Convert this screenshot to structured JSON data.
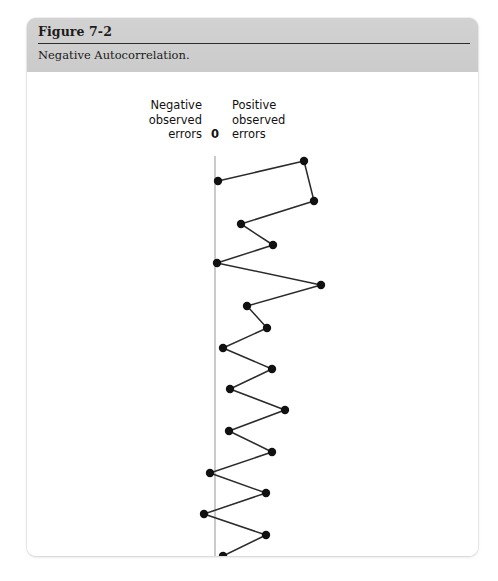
{
  "figure": {
    "number": "Figure 7-2",
    "caption": "Negative Autocorrelation."
  },
  "labels": {
    "negative": "Negative\nobserved\nerrors",
    "negative_line1": "Negative",
    "negative_line2": "observed",
    "negative_line3": "errors",
    "zero": "0",
    "positive_line1": "Positive",
    "positive_line2": "observed",
    "positive_line3": "errors"
  },
  "colors": {
    "header_background": "#cfcfcf",
    "card_background": "#ffffff",
    "page_background": "#ffffff",
    "rule": "#2b2b2b",
    "axis_line": "#b4b4b4",
    "series_line": "#2b2b2b",
    "marker": "#111111",
    "text": "#1b1b1b"
  },
  "chart_data": {
    "type": "line",
    "title": "Negative Autocorrelation.",
    "subtitle": "Figure 7-2",
    "xlabel": "",
    "ylabel": "",
    "orientation": "vertical-sequence",
    "grid": false,
    "legend": false,
    "axis": {
      "zero_label": "0",
      "zero_x": 188,
      "left_label": "Negative observed errors",
      "right_label": "Positive observed errors",
      "line_top": 84,
      "line_bottom": 491,
      "x_min": 150,
      "x_max": 275
    },
    "marker": {
      "shape": "circle",
      "radius": 4.2,
      "color": "#111111"
    },
    "series": [
      {
        "name": "Observed errors",
        "points": [
          {
            "index": 1,
            "error": -26,
            "x": 191,
            "y": 109
          },
          {
            "index": 2,
            "error": 31,
            "x": 277,
            "y": 89
          },
          {
            "index": 3,
            "error": 40,
            "x": 287,
            "y": 129
          },
          {
            "index": 4,
            "error": -12,
            "x": 214,
            "y": 152
          },
          {
            "index": 5,
            "error": 11,
            "x": 246,
            "y": 173
          },
          {
            "index": 6,
            "error": -27,
            "x": 190,
            "y": 191
          },
          {
            "index": 7,
            "error": 47,
            "x": 294,
            "y": 213
          },
          {
            "index": 8,
            "error": -6,
            "x": 220,
            "y": 234
          },
          {
            "index": 9,
            "error": -5,
            "x": 221,
            "y": 235
          },
          {
            "index": 10,
            "error": 8,
            "x": 240,
            "y": 256
          },
          {
            "index": 11,
            "error": -18,
            "x": 196,
            "y": 276
          },
          {
            "index": 12,
            "error": 10,
            "x": 245,
            "y": 297
          },
          {
            "index": 13,
            "error": -15,
            "x": 203,
            "y": 317
          },
          {
            "index": 14,
            "error": 35,
            "x": 258,
            "y": 338
          },
          {
            "index": 15,
            "error": -16,
            "x": 202,
            "y": 359
          },
          {
            "index": 16,
            "error": 10,
            "x": 245,
            "y": 380
          },
          {
            "index": 17,
            "error": -24,
            "x": 183,
            "y": 401
          },
          {
            "index": 18,
            "error": 9,
            "x": 239,
            "y": 421
          },
          {
            "index": 19,
            "error": -27,
            "x": 177,
            "y": 442
          },
          {
            "index": 20,
            "error": 9,
            "x": 239,
            "y": 463
          },
          {
            "index": 21,
            "error": -11,
            "x": 196,
            "y": 484
          }
        ]
      }
    ]
  }
}
